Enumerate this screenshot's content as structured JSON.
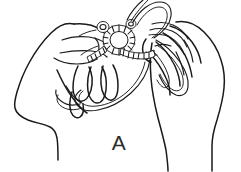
{
  "figure": {
    "label": "A",
    "style": "black-and-white line art illustration",
    "background_color": "#ffffff",
    "ink_color": "#1a1a1a",
    "caption_color": "#2b2b2b",
    "width": 241,
    "height": 172,
    "parts": [
      {
        "name": "left-hand",
        "label": "left hand, fingers curled holding thread"
      },
      {
        "name": "right-hand",
        "label": "right hand, fingers extended with thread loops"
      },
      {
        "name": "lace-ring",
        "label": "tatted lace ring with picot stitches"
      },
      {
        "name": "thread-loops",
        "label": "looped working thread"
      }
    ]
  }
}
